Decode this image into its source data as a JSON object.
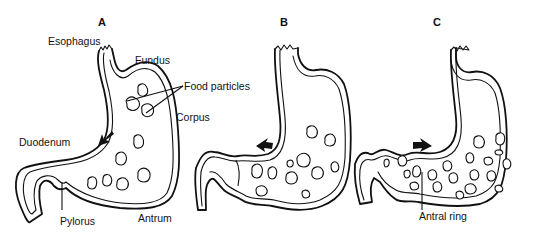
{
  "figure": {
    "panels": [
      {
        "id": "A",
        "labels": {
          "esophagus": "Esophagus",
          "fundus": "Fundus",
          "food_particles": "Food particles",
          "corpus": "Corpus",
          "duodenum": "Duodenum",
          "pylorus": "Pylorus",
          "antrum": "Antrum"
        },
        "contraction_arrow": "down-left"
      },
      {
        "id": "B",
        "labels": {},
        "contraction_arrow": "left"
      },
      {
        "id": "C",
        "labels": {
          "antral_ring": "Antral ring"
        },
        "contraction_arrow": "right"
      }
    ]
  }
}
